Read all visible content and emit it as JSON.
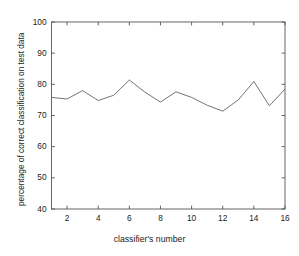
{
  "chart_data": {
    "type": "line",
    "title": "",
    "xlabel": "classifier's number",
    "ylabel": "percentage of correct classification on test data",
    "x": [
      1,
      2,
      3,
      4,
      5,
      6,
      7,
      8,
      9,
      10,
      11,
      12,
      13,
      14,
      15,
      16
    ],
    "values": [
      75.8,
      75.3,
      78.0,
      74.8,
      76.5,
      81.4,
      77.5,
      74.3,
      77.6,
      75.8,
      73.3,
      71.4,
      75.0,
      80.9,
      73.1,
      78.5
    ],
    "series": [
      {
        "name": "percentage of correct classification on test data",
        "values": [
          75.8,
          75.3,
          78.0,
          74.8,
          76.5,
          81.4,
          77.5,
          74.3,
          77.6,
          75.8,
          73.3,
          71.4,
          75.0,
          80.9,
          73.1,
          78.5
        ]
      }
    ],
    "xlim": [
      1,
      16
    ],
    "ylim": [
      40,
      100
    ],
    "xticks": [
      2,
      4,
      6,
      8,
      10,
      12,
      14,
      16
    ],
    "yticks": [
      40,
      50,
      60,
      70,
      80,
      90,
      100
    ],
    "xtick_labels": [
      "2",
      "4",
      "6",
      "8",
      "10",
      "12",
      "14",
      "16"
    ],
    "ytick_labels": [
      "40",
      "50",
      "60",
      "70",
      "80",
      "90",
      "100"
    ],
    "grid": false,
    "legend": null,
    "legend_position": "none",
    "line_color": "#5a5a5a",
    "axis_color": "#555555",
    "background_color": "#ffffff",
    "annotations": []
  }
}
